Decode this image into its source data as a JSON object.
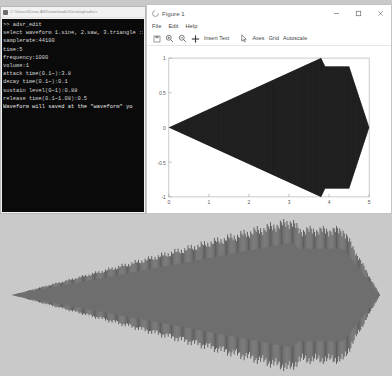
{
  "cmd_window": {
    "title": "C:\\Users\\Drive-All\\Downloads\\Desktop\\adsr>",
    "icon": "console-icon",
    "lines": [
      ">> adsr_edit",
      "select waveform 1.sine, 2.saw, 3.triangle :1",
      "samplerate:44100",
      "time:5",
      "frequency:1000",
      "volume:1",
      "attack time(0.1~):3.8",
      "decay time(0.1~):0.1",
      "sustain level(0~1):0.88",
      "release time(0.1~1.08):0.5",
      "Waveform will saved at the \"waveform\" yo"
    ]
  },
  "figure_window": {
    "title": "Figure 1",
    "app_icon": "matplotlib-icon",
    "window_controls": [
      {
        "name": "minimize-button",
        "glyph": "–"
      },
      {
        "name": "maximize-button",
        "glyph": "☐"
      },
      {
        "name": "close-button",
        "glyph": "✕"
      }
    ],
    "menu": [
      "File",
      "Edit",
      "Help"
    ],
    "toolbar": [
      {
        "name": "save-icon",
        "label": "",
        "icon": "save-icon"
      },
      {
        "name": "zoom-in-button",
        "label": "",
        "icon": "zoom-in-icon"
      },
      {
        "name": "zoom-out-button",
        "label": "",
        "icon": "zoom-out-icon"
      },
      {
        "name": "pan-button",
        "label": "",
        "icon": "pan-icon"
      },
      {
        "name": "insert-text-button",
        "label": "Insert Text",
        "icon": ""
      },
      {
        "name": "cursor-button",
        "label": "",
        "icon": "cursor-icon"
      },
      {
        "name": "axes-button",
        "label": "Axes",
        "icon": ""
      },
      {
        "name": "grid-button",
        "label": "Grid",
        "icon": ""
      },
      {
        "name": "autoscale-button",
        "label": "Autoscale",
        "icon": ""
      }
    ]
  },
  "chart_data": {
    "type": "area",
    "title": "",
    "xlabel": "",
    "ylabel": "",
    "xlim": [
      0,
      5
    ],
    "ylim": [
      -1,
      1
    ],
    "xticks": [
      0,
      1,
      2,
      3,
      4,
      5
    ],
    "yticks": [
      1,
      0.5,
      0,
      -0.5,
      -1
    ],
    "grid": false,
    "legend": null,
    "series": [
      {
        "name": "ADSR envelope (upper)",
        "description": "ADSR amplitude envelope of a 1000 Hz sine, 5 s, attack 3.8 s, decay 0.1 s, sustain 0.88, release 0.5 s",
        "x": [
          0,
          3.8,
          3.9,
          4.5,
          5.0
        ],
        "values": [
          0,
          1.0,
          0.88,
          0.88,
          0
        ]
      },
      {
        "name": "ADSR envelope (lower)",
        "x": [
          0,
          3.8,
          3.9,
          4.5,
          5.0
        ],
        "values": [
          0,
          -1.0,
          -0.88,
          -0.88,
          0
        ]
      }
    ],
    "fill_color": "#262626",
    "axes_color": "#a8a8a8",
    "background": "#ffffff"
  },
  "waveform_panel": {
    "name": "waveform-preview",
    "description": "Rendered ADSR-shaped audio waveform preview",
    "colors": {
      "background": "#c9c9c9",
      "outer_waveform": "#4b4b4b",
      "inner_envelope": "#6e6e6e"
    },
    "envelope": {
      "x": [
        0,
        3.8,
        3.9,
        4.5,
        5.0
      ],
      "upper": [
        0,
        1.0,
        0.88,
        0.88,
        0
      ],
      "lower": [
        0,
        -1.0,
        -0.88,
        -0.88,
        0
      ]
    }
  }
}
